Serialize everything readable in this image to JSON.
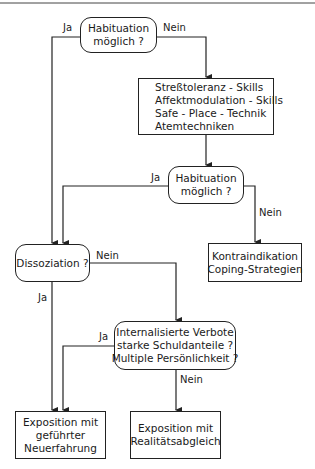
{
  "diagram": {
    "type": "flowchart",
    "nodes": {
      "habituation1": {
        "shape": "decision",
        "lines": [
          "Habituation",
          "möglich ?"
        ]
      },
      "skills": {
        "shape": "process",
        "lines": [
          "Streßtoleranz - Skills",
          "Affektmodulation - Skills",
          "Safe - Place - Technik",
          "Atemtechniken"
        ]
      },
      "habituation2": {
        "shape": "decision",
        "lines": [
          "Habituation",
          "möglich ?"
        ]
      },
      "kontraindikation": {
        "shape": "process",
        "lines": [
          "Kontraindikation",
          "Coping-Strategien"
        ]
      },
      "dissoziation": {
        "shape": "decision",
        "lines": [
          "Dissoziation ?"
        ]
      },
      "verbote": {
        "shape": "decision",
        "lines": [
          "Internalisierte Verbote",
          "starke Schuldanteile ?",
          "Multiple Persönlichkeit ?"
        ]
      },
      "neuerfahrung": {
        "shape": "process",
        "lines": [
          "Exposition mit",
          "geführter",
          "Neuerfahrung"
        ]
      },
      "realitaet": {
        "shape": "process",
        "lines": [
          "Exposition mit",
          "Realitätsabgleich"
        ]
      }
    },
    "edge_labels": {
      "h1_ja": "Ja",
      "h1_nein": "Nein",
      "h2_ja": "Ja",
      "h2_nein": "Nein",
      "diss_ja": "Ja",
      "diss_nein": "Nein",
      "verbote_ja": "Ja",
      "verbote_nein": "Nein"
    },
    "edges": [
      {
        "from": "habituation1",
        "to": "skills",
        "label": "Nein"
      },
      {
        "from": "habituation1",
        "to": "dissoziation",
        "label": "Ja"
      },
      {
        "from": "skills",
        "to": "habituation2",
        "label": ""
      },
      {
        "from": "habituation2",
        "to": "dissoziation",
        "label": "Ja"
      },
      {
        "from": "habituation2",
        "to": "kontraindikation",
        "label": "Nein"
      },
      {
        "from": "dissoziation",
        "to": "neuerfahrung",
        "label": "Ja"
      },
      {
        "from": "dissoziation",
        "to": "verbote",
        "label": "Nein"
      },
      {
        "from": "verbote",
        "to": "neuerfahrung",
        "label": "Ja"
      },
      {
        "from": "verbote",
        "to": "realitaet",
        "label": "Nein"
      }
    ]
  }
}
